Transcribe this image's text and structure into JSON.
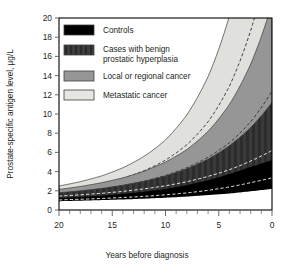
{
  "chart_data": {
    "type": "area",
    "title": "",
    "xlabel": "Years before diagnosis",
    "ylabel": "Prostate-specific antigen level, µg/L",
    "xlim": [
      20,
      0
    ],
    "ylim": [
      0,
      20
    ],
    "x_reversed": true,
    "grid": false,
    "legend_position": "top-left-inside",
    "x_major_ticks": [
      20,
      15,
      10,
      5,
      0
    ],
    "x_minor_tick_step": 1,
    "y_ticks": [
      0,
      2,
      4,
      6,
      8,
      10,
      12,
      14,
      16,
      18,
      20
    ],
    "x": [
      20,
      18,
      16,
      14,
      12,
      10,
      8,
      6,
      4,
      2,
      0
    ],
    "series": [
      {
        "name": "Controls",
        "color": "#000000",
        "median": [
          1.05,
          1.12,
          1.2,
          1.3,
          1.42,
          1.58,
          1.78,
          2.05,
          2.4,
          2.85,
          3.35
        ],
        "lower": [
          0.92,
          0.97,
          1.03,
          1.1,
          1.18,
          1.28,
          1.4,
          1.55,
          1.72,
          1.95,
          2.2
        ],
        "upper": [
          1.25,
          1.36,
          1.5,
          1.68,
          1.9,
          2.2,
          2.6,
          3.1,
          3.75,
          4.5,
          5.2
        ]
      },
      {
        "name": "Cases with benign prostatic hyperplasia",
        "color": "#3a3a3a",
        "median": [
          1.45,
          1.58,
          1.74,
          1.94,
          2.2,
          2.52,
          2.95,
          3.5,
          4.2,
          5.1,
          6.2
        ],
        "lower": [
          1.15,
          1.24,
          1.35,
          1.48,
          1.64,
          1.84,
          2.08,
          2.4,
          2.8,
          3.3,
          3.9
        ],
        "upper": [
          1.8,
          2.0,
          2.25,
          2.58,
          3.0,
          3.55,
          4.3,
          5.3,
          6.7,
          8.6,
          11.2
        ]
      },
      {
        "name": "Local or regional cancer",
        "color": "#969696",
        "median": [
          1.7,
          1.92,
          2.2,
          2.55,
          3.0,
          3.6,
          4.4,
          5.5,
          7.0,
          9.2,
          12.4
        ],
        "lower": [
          1.35,
          1.5,
          1.68,
          1.9,
          2.18,
          2.52,
          2.98,
          3.6,
          4.45,
          5.6,
          7.2
        ],
        "upper": [
          2.15,
          2.45,
          2.85,
          3.35,
          4.05,
          5.0,
          6.3,
          8.2,
          11.0,
          15.2,
          21.5
        ]
      },
      {
        "name": "Metastatic cancer",
        "color": "#dededa",
        "median": [
          2.0,
          2.32,
          2.75,
          3.3,
          4.1,
          5.2,
          6.8,
          9.2,
          12.9,
          18.7,
          27.5
        ],
        "lower": [
          1.6,
          1.82,
          2.1,
          2.48,
          3.0,
          3.7,
          4.7,
          6.2,
          8.4,
          11.8,
          17.0
        ],
        "upper": [
          2.5,
          2.95,
          3.55,
          4.4,
          5.6,
          7.3,
          9.9,
          13.9,
          20.2,
          30.5,
          47.0
        ]
      }
    ]
  },
  "legend": {
    "items": [
      {
        "label": "Controls",
        "swatch": "controls-swatch"
      },
      {
        "label": "Cases with benign",
        "label2": "prostatic hyperplasia",
        "swatch": "bph-swatch"
      },
      {
        "label": "Local or regional cancer",
        "swatch": "local-regional-swatch"
      },
      {
        "label": "Metastatic cancer",
        "swatch": "metastatic-swatch"
      }
    ]
  },
  "axes": {
    "y_title": "Prostate-specific antigen level, µg/L",
    "x_title": "Years before diagnosis",
    "y_labels": [
      "20",
      "18",
      "16",
      "14",
      "12",
      "10",
      "8",
      "6",
      "4",
      "2",
      "0"
    ],
    "x_labels": [
      "20",
      "15",
      "10",
      "5",
      "0"
    ]
  },
  "colors": {
    "controls": "#000000",
    "bph": "#3a3a3a",
    "local_regional": "#969696",
    "metastatic": "#dededa",
    "frame": "#000000",
    "text": "#231f20",
    "background": "#ffffff"
  }
}
